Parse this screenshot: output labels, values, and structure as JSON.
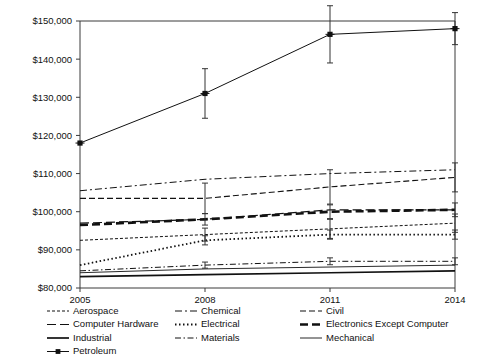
{
  "chart_data": {
    "type": "line",
    "title": "",
    "subtitle": "",
    "xlabel": "",
    "ylabel": "",
    "x": [
      2005,
      2008,
      2011,
      2014
    ],
    "xtick_labels": [
      "2005",
      "2008",
      "2011",
      "2014"
    ],
    "ytick_labels": [
      "$80,000",
      "$90,000",
      "$100,000",
      "$110,000",
      "$120,000",
      "$130,000",
      "$140,000",
      "$150,000"
    ],
    "ytick_values": [
      80000,
      90000,
      100000,
      110000,
      120000,
      130000,
      140000,
      150000
    ],
    "ylim": [
      80000,
      150000
    ],
    "xlim": [
      2005,
      2014
    ],
    "grid": false,
    "legend_position": "bottom",
    "error_bars": true,
    "series": [
      {
        "name": "Aerospace",
        "dash": "3,2",
        "width": 1,
        "marker": "none",
        "values": [
          92500,
          94000,
          95500,
          97000
        ],
        "errors": [
          0,
          1700,
          2500,
          2400
        ]
      },
      {
        "name": "Chemical",
        "dash": "7,3,2,3",
        "width": 1,
        "marker": "none",
        "values": [
          105500,
          108500,
          110000,
          111000
        ],
        "errors": [
          0,
          0,
          0,
          0
        ]
      },
      {
        "name": "Civil",
        "dash": "6,3",
        "width": 1.1,
        "marker": "none",
        "values": [
          103500,
          103500,
          106500,
          109000
        ],
        "errors": [
          0,
          4000,
          4500,
          3800
        ]
      },
      {
        "name": "Computer Hardware",
        "dash": "9,4",
        "width": 1.2,
        "marker": "none",
        "values": [
          97000,
          98000,
          100500,
          100500
        ],
        "errors": [
          0,
          0,
          0,
          0
        ]
      },
      {
        "name": "Electrical",
        "dash": "1.5,2.5",
        "width": 1.8,
        "marker": "none",
        "values": [
          86000,
          92500,
          94000,
          94000
        ],
        "errors": [
          0,
          1200,
          1200,
          1200
        ]
      },
      {
        "name": "Electronics Except Computer",
        "dash": "8,4",
        "width": 2.6,
        "marker": "none",
        "values": [
          96500,
          98000,
          100000,
          100500
        ],
        "errors": [
          0,
          1500,
          1800,
          1800
        ]
      },
      {
        "name": "Industrial",
        "dash": "none",
        "width": 1.7,
        "marker": "none",
        "values": [
          83000,
          83500,
          84000,
          84500
        ],
        "errors": [
          0,
          0,
          0,
          0
        ]
      },
      {
        "name": "Materials",
        "dash": "6,2.5,1.5,2.5",
        "width": 1,
        "marker": "none",
        "values": [
          84500,
          86000,
          87000,
          87000
        ],
        "errors": [
          0,
          800,
          900,
          900
        ]
      },
      {
        "name": "Mechanical",
        "dash": "none",
        "width": 0.9,
        "marker": "none",
        "values": [
          84000,
          85000,
          85500,
          86000
        ],
        "errors": [
          0,
          0,
          0,
          0
        ]
      },
      {
        "name": "Petroleum",
        "dash": "none",
        "width": 1,
        "marker": "x-square",
        "values": [
          118000,
          131000,
          146500,
          148000
        ],
        "errors": [
          0,
          6500,
          7500,
          4200
        ]
      }
    ]
  },
  "legend": {
    "columns": [
      [
        "Aerospace",
        "Computer Hardware",
        "Industrial",
        "Petroleum"
      ],
      [
        "Chemical",
        "Electrical",
        "Materials"
      ],
      [
        "Civil",
        "Electronics Except Computer",
        "Mechanical"
      ]
    ]
  },
  "colors": {
    "background": "#ffffff",
    "axis": "#3a3a3a",
    "series": "#111111",
    "text": "#111111"
  }
}
